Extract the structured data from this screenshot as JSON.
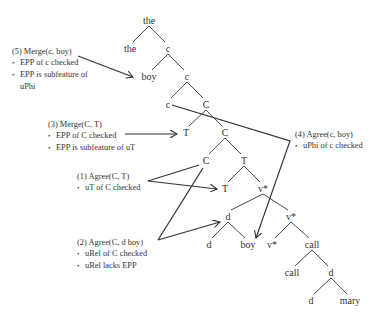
{
  "diagram": {
    "type": "syntax-tree",
    "colors": {
      "text": "#333333",
      "line": "#333333",
      "background": "#ffffff"
    },
    "nodes": [
      {
        "id": "n_the_root",
        "label": "the",
        "x": 149,
        "y": 20
      },
      {
        "id": "n_the",
        "label": "the",
        "x": 130,
        "y": 48
      },
      {
        "id": "n_c1",
        "label": "c",
        "x": 168,
        "y": 48
      },
      {
        "id": "n_boy1",
        "label": "boy",
        "x": 149,
        "y": 76
      },
      {
        "id": "n_c2",
        "label": "c",
        "x": 187,
        "y": 76
      },
      {
        "id": "n_c3",
        "label": "c",
        "x": 168,
        "y": 104
      },
      {
        "id": "n_C1",
        "label": "C",
        "x": 206,
        "y": 104
      },
      {
        "id": "n_T1",
        "label": "T",
        "x": 186,
        "y": 132
      },
      {
        "id": "n_C2",
        "label": "C",
        "x": 225,
        "y": 132
      },
      {
        "id": "n_C3",
        "label": "C",
        "x": 206,
        "y": 160
      },
      {
        "id": "n_T2",
        "label": "T",
        "x": 244,
        "y": 160
      },
      {
        "id": "n_T3",
        "label": "T",
        "x": 225,
        "y": 188
      },
      {
        "id": "n_v1",
        "label": "v*",
        "x": 263,
        "y": 188
      },
      {
        "id": "n_d1",
        "label": "d",
        "x": 228,
        "y": 216
      },
      {
        "id": "n_v2",
        "label": "v*",
        "x": 291,
        "y": 216
      },
      {
        "id": "n_d2",
        "label": "d",
        "x": 209,
        "y": 244
      },
      {
        "id": "n_boy2",
        "label": "boy",
        "x": 248,
        "y": 244
      },
      {
        "id": "n_v3",
        "label": "v*",
        "x": 272,
        "y": 244
      },
      {
        "id": "n_call1",
        "label": "call",
        "x": 312,
        "y": 244
      },
      {
        "id": "n_call2",
        "label": "call",
        "x": 292,
        "y": 272
      },
      {
        "id": "n_d3",
        "label": "d",
        "x": 331,
        "y": 272
      },
      {
        "id": "n_d4",
        "label": "d",
        "x": 311,
        "y": 300
      },
      {
        "id": "n_mary",
        "label": "mary",
        "x": 350,
        "y": 300
      }
    ],
    "edges": [
      [
        "n_the_root",
        "n_the"
      ],
      [
        "n_the_root",
        "n_c1"
      ],
      [
        "n_c1",
        "n_boy1"
      ],
      [
        "n_c1",
        "n_c2"
      ],
      [
        "n_c2",
        "n_c3"
      ],
      [
        "n_c2",
        "n_C1"
      ],
      [
        "n_C1",
        "n_T1"
      ],
      [
        "n_C1",
        "n_C2"
      ],
      [
        "n_C2",
        "n_C3"
      ],
      [
        "n_C2",
        "n_T2"
      ],
      [
        "n_T2",
        "n_T3"
      ],
      [
        "n_T2",
        "n_v1"
      ],
      [
        "n_v1",
        "n_d1"
      ],
      [
        "n_v1",
        "n_v2"
      ],
      [
        "n_d1",
        "n_d2"
      ],
      [
        "n_d1",
        "n_boy2"
      ],
      [
        "n_v2",
        "n_v3"
      ],
      [
        "n_v2",
        "n_call1"
      ],
      [
        "n_call1",
        "n_call2"
      ],
      [
        "n_call1",
        "n_d3"
      ],
      [
        "n_d3",
        "n_d4"
      ],
      [
        "n_d3",
        "n_mary"
      ]
    ],
    "annotations": [
      {
        "id": "note5",
        "x": 12,
        "y": 46,
        "title": "(5) Merge(c, boy)",
        "bullets": [
          "EPP of c checked",
          "EPP is subfeature of"
        ],
        "continuation": "uPhi"
      },
      {
        "id": "note3",
        "x": 48,
        "y": 119,
        "title": "(3) Merge(C, T)",
        "bullets": [
          "EPP of C checked",
          "EPP is subfeature of uT"
        ]
      },
      {
        "id": "note4",
        "x": 295,
        "y": 129,
        "title": "(4) Agree(c, boy)",
        "bullets": [
          "uPhi of c checked"
        ]
      },
      {
        "id": "note1",
        "x": 77,
        "y": 171,
        "title": "(1) Agree(C, T)",
        "bullets": [
          "uT of C checked"
        ]
      },
      {
        "id": "note2",
        "x": 77,
        "y": 237,
        "title": "(2) Agree(C, d boy)",
        "bullets": [
          "uRel of C checked",
          "uRel lacks EPP"
        ]
      }
    ],
    "connectors": [
      {
        "id": "arrow5",
        "points": [
          [
            78,
            56
          ],
          [
            133,
            77
          ]
        ],
        "arrow": true
      },
      {
        "id": "arrow3",
        "points": [
          [
            125,
            134
          ],
          [
            177,
            134
          ]
        ],
        "arrow": true
      },
      {
        "id": "line4",
        "points": [
          [
            172,
            105
          ],
          [
            290,
            141
          ],
          [
            256,
            238
          ]
        ],
        "arrow": true
      },
      {
        "id": "line1a",
        "points": [
          [
            148,
            181
          ],
          [
            199,
            165
          ]
        ],
        "arrow": false
      },
      {
        "id": "arrow1b",
        "points": [
          [
            148,
            181
          ],
          [
            217,
            189
          ]
        ],
        "arrow": true
      },
      {
        "id": "line2a",
        "points": [
          [
            158,
            240
          ],
          [
            203,
            168
          ]
        ],
        "arrow": false
      },
      {
        "id": "arrow2b",
        "points": [
          [
            158,
            240
          ],
          [
            220,
            222
          ]
        ],
        "arrow": true
      }
    ]
  }
}
